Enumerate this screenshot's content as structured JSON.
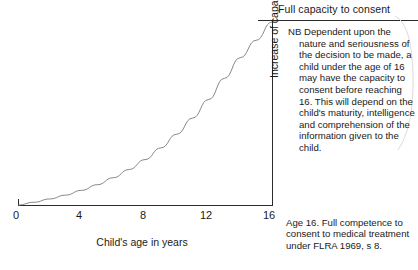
{
  "header": {
    "title": "Full capacity to consent"
  },
  "axes": {
    "xlabel": "Child's age in years",
    "ylabel": "Increase of capacity to consent",
    "xticks": [
      "0",
      "4",
      "8",
      "12",
      "16"
    ]
  },
  "annotations": {
    "nb_note": "NB Dependent upon the nature and seriousness of the decision to be made, a child under the age of 16 may have the capacity to consent before reaching 16. This will depend on the child's maturity, intelligence and comprehension of the information given to the child.",
    "footnote": "Age 16. Full competence to consent to medical treatment under FLRA 1969, s 8."
  },
  "colors": {
    "ink": "#1a1a1a",
    "axis": "#2b2b2b",
    "curve": "#7a7a7a",
    "brace": "#d8d8d8",
    "background": "#ffffff"
  },
  "chart_data": {
    "type": "line",
    "title": "Full capacity to consent",
    "xlabel": "Child's age in years",
    "ylabel": "Increase of capacity to consent",
    "xlim": [
      0,
      16
    ],
    "ylim": [
      0,
      100
    ],
    "xticks": [
      0,
      4,
      8,
      12,
      16
    ],
    "yticks": [],
    "grid": false,
    "legend": null,
    "series": [
      {
        "name": "Capacity to consent",
        "x": [
          0,
          1,
          2,
          3,
          4,
          5,
          6,
          7,
          8,
          9,
          10,
          11,
          12,
          13,
          14,
          15,
          16
        ],
        "values": [
          0,
          1.5,
          3.3,
          5.4,
          8.0,
          11.1,
          14.9,
          19.4,
          24.8,
          31.2,
          38.7,
          47.5,
          57.6,
          69.2,
          80.5,
          90.0,
          100
        ]
      }
    ],
    "annotations": [
      "NB Dependent upon the nature and seriousness of the decision to be made, a child under the age of 16 may have the capacity to consent before reaching 16. This will depend on the child's maturity, intelligence and comprehension of the information given to the child.",
      "Age 16. Full competence to consent to medical treatment under FLRA 1969, s 8."
    ]
  }
}
